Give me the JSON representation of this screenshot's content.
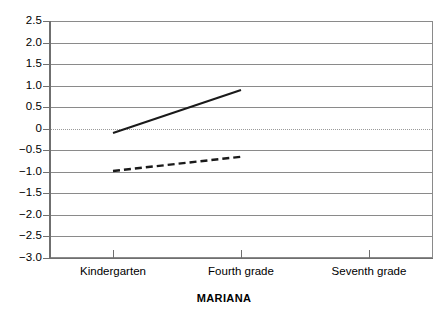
{
  "chart_data": {
    "type": "line",
    "title": "",
    "xlabel": "MARIANA",
    "ylabel": "",
    "categories": [
      "Kindergarten",
      "Fourth grade",
      "Seventh grade"
    ],
    "ytick_labels": [
      "2.5",
      "2.0",
      "1.5",
      "1.0",
      "0.5",
      "0",
      "−0.5",
      "−1.0",
      "−1.5",
      "−2.0",
      "−2.5",
      "−3.0"
    ],
    "ytick_values": [
      2.5,
      2.0,
      1.5,
      1.0,
      0.5,
      0,
      -0.5,
      -1.0,
      -1.5,
      -2.0,
      -2.5,
      -3.0
    ],
    "ylim": [
      -3.0,
      2.5
    ],
    "grid": true,
    "zero_line": true,
    "legend": "none",
    "series": [
      {
        "name": "solid-series",
        "style": "solid",
        "color": "#1a1a1a",
        "x": [
          "Kindergarten",
          "Fourth grade"
        ],
        "values": [
          -0.1,
          0.9
        ]
      },
      {
        "name": "dashed-series",
        "style": "dashed",
        "color": "#1a1a1a",
        "x": [
          "Kindergarten",
          "Fourth grade"
        ],
        "values": [
          -0.98,
          -0.65
        ]
      }
    ]
  },
  "axis": {
    "x_title": "MARIANA"
  }
}
